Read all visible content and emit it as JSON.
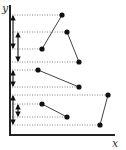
{
  "diagram": {
    "type": "axes-with-segment-projections",
    "axes": {
      "x_label": "x",
      "y_label": "y",
      "origin": [
        10,
        135
      ],
      "x_end": 115,
      "y_end": 5,
      "color": "#222222"
    },
    "colors": {
      "dot": "#111111",
      "segment": "#444444",
      "dotted": "#666666",
      "arrow": "#111111"
    },
    "segments": [
      {
        "id": "s1",
        "p1": [
          62,
          15
        ],
        "p2": [
          42,
          49
        ]
      },
      {
        "id": "s2",
        "p1": [
          67,
          32
        ],
        "p2": [
          79,
          62
        ]
      },
      {
        "id": "s3",
        "p1": [
          38,
          70
        ],
        "p2": [
          79,
          87
        ]
      },
      {
        "id": "s4",
        "p1": [
          108,
          95
        ],
        "p2": [
          100,
          125
        ]
      },
      {
        "id": "s5",
        "p1": [
          42,
          104
        ],
        "p2": [
          67,
          117
        ]
      }
    ],
    "projection_arrows": [
      {
        "id": "a1",
        "x": 13,
        "y1": 15,
        "y2": 49
      },
      {
        "id": "a2",
        "x": 18,
        "y1": 32,
        "y2": 62
      },
      {
        "id": "a3",
        "x": 13,
        "y1": 70,
        "y2": 87
      },
      {
        "id": "a4",
        "x": 13,
        "y1": 95,
        "y2": 125
      },
      {
        "id": "a5",
        "x": 18,
        "y1": 104,
        "y2": 117
      }
    ]
  }
}
